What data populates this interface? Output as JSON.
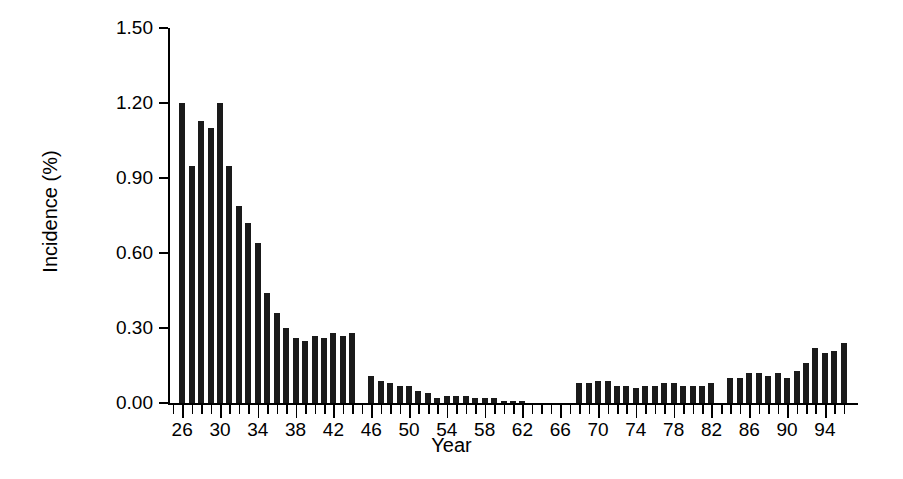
{
  "chart_data": {
    "type": "bar",
    "title": "",
    "subtitle": "",
    "xlabel": "Year",
    "ylabel": "Incidence (%)",
    "ylim": [
      0.0,
      1.5
    ],
    "yticks": [
      0.0,
      0.3,
      0.6,
      0.9,
      1.2,
      1.5
    ],
    "ytick_labels": [
      "0.00",
      "0.30",
      "0.60",
      "0.90",
      "1.20",
      "1.50"
    ],
    "xlim": [
      24.5,
      97.5
    ],
    "xtick_labels": [
      "26",
      "30",
      "34",
      "38",
      "42",
      "46",
      "50",
      "54",
      "58",
      "62",
      "66",
      "70",
      "74",
      "78",
      "82",
      "86",
      "90",
      "94"
    ],
    "xtick_values": [
      26,
      30,
      34,
      38,
      42,
      46,
      50,
      54,
      58,
      62,
      66,
      70,
      74,
      78,
      82,
      86,
      90,
      94
    ],
    "xtick_minor_step": 1,
    "grid": false,
    "legend": null,
    "bar_color": "#1a1a1a",
    "categories": [
      26,
      27,
      28,
      29,
      30,
      31,
      32,
      33,
      34,
      35,
      36,
      37,
      38,
      39,
      40,
      41,
      42,
      43,
      44,
      45,
      46,
      47,
      48,
      49,
      50,
      51,
      52,
      53,
      54,
      55,
      56,
      57,
      58,
      59,
      60,
      61,
      62,
      63,
      64,
      65,
      66,
      67,
      68,
      69,
      70,
      71,
      72,
      73,
      74,
      75,
      76,
      77,
      78,
      79,
      80,
      81,
      82,
      83,
      84,
      85,
      86,
      87,
      88,
      89,
      90,
      91,
      92,
      93,
      94,
      95,
      96
    ],
    "values": [
      1.2,
      0.95,
      1.13,
      1.1,
      1.2,
      0.95,
      0.79,
      0.72,
      0.64,
      0.44,
      0.36,
      0.3,
      0.26,
      0.25,
      0.27,
      0.26,
      0.28,
      0.27,
      0.28,
      0.0,
      0.11,
      0.09,
      0.08,
      0.07,
      0.07,
      0.05,
      0.04,
      0.02,
      0.03,
      0.03,
      0.03,
      0.02,
      0.02,
      0.02,
      0.01,
      0.01,
      0.01,
      0.0,
      0.0,
      0.0,
      0.0,
      0.0,
      0.08,
      0.08,
      0.09,
      0.09,
      0.07,
      0.07,
      0.06,
      0.07,
      0.07,
      0.08,
      0.08,
      0.07,
      0.07,
      0.07,
      0.08,
      0.0,
      0.1,
      0.1,
      0.12,
      0.12,
      0.11,
      0.12,
      0.1,
      0.13,
      0.16,
      0.22,
      0.2,
      0.21,
      0.24
    ]
  }
}
